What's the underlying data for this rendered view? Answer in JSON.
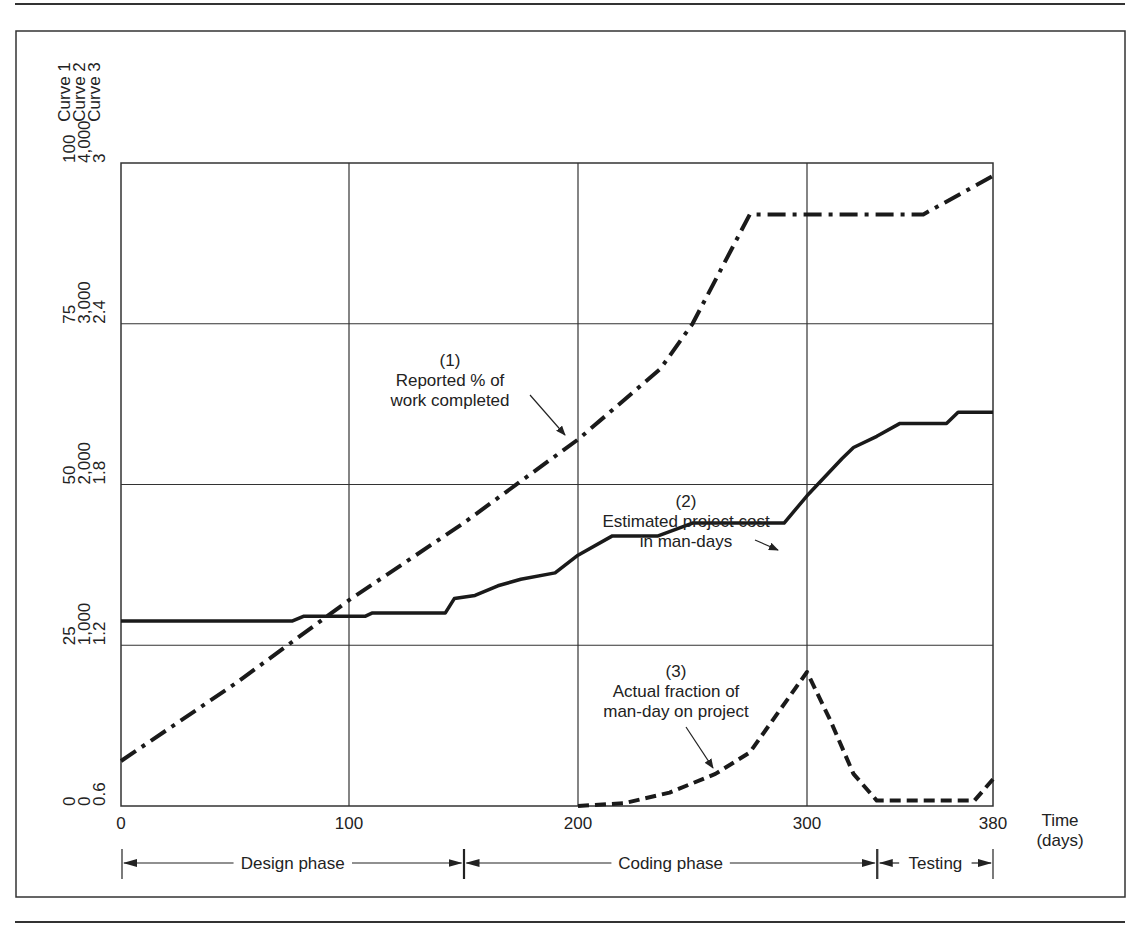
{
  "figure": {
    "y_axis_headers": [
      "Curve 1",
      "Curve 2",
      "Curve 3"
    ],
    "y_ticks": {
      "curve1": [
        "0",
        "25",
        "50",
        "75",
        "100"
      ],
      "curve2": [
        "0",
        "1,000",
        "2,000",
        "3,000",
        "4,000"
      ],
      "curve3": [
        "0.6",
        "1.2",
        "1.8",
        "2.4",
        "3"
      ]
    },
    "x_ticks": [
      "0",
      "100",
      "200",
      "300",
      "380"
    ],
    "x_label_line1": "Time",
    "x_label_line2": "(days)",
    "annotations": {
      "curve1": {
        "num": "(1)",
        "line1": "Reported % of",
        "line2": "work completed"
      },
      "curve2": {
        "num": "(2)",
        "line1": "Estimated project cost",
        "line2": "in man-days"
      },
      "curve3": {
        "num": "(3)",
        "line1": "Actual fraction of",
        "line2": "man-day on project"
      }
    },
    "phases": [
      {
        "label": "Design phase",
        "start": 0,
        "end": 150
      },
      {
        "label": "Coding phase",
        "start": 150,
        "end": 330
      },
      {
        "label": "Testing",
        "start": 330,
        "end": 380
      }
    ]
  },
  "chart_data": {
    "type": "line",
    "title": "",
    "xlabel": "Time (days)",
    "ylabel": "Curve 1 (%) / Curve 2 (man-days) / Curve 3 (fraction)",
    "xlim": [
      0,
      380
    ],
    "grid": true,
    "x_ticks": [
      0,
      100,
      200,
      300,
      380
    ],
    "y_axes": [
      {
        "name": "Curve 1",
        "range": [
          0,
          100
        ],
        "ticks": [
          0,
          25,
          50,
          75,
          100
        ]
      },
      {
        "name": "Curve 2",
        "range": [
          0,
          4000
        ],
        "ticks": [
          0,
          1000,
          2000,
          3000,
          4000
        ]
      },
      {
        "name": "Curve 3",
        "range": [
          0.6,
          3
        ],
        "ticks": [
          0.6,
          1.2,
          1.8,
          2.4,
          3
        ]
      }
    ],
    "series": [
      {
        "name": "(1) Reported % of work completed",
        "axis": "Curve 1",
        "style": "dash-dot",
        "x": [
          0,
          50,
          100,
          150,
          200,
          236,
          250,
          275,
          300,
          350,
          380
        ],
        "y": [
          7,
          19,
          32,
          44,
          57,
          68,
          75,
          92,
          92,
          92,
          98
        ]
      },
      {
        "name": "(2) Estimated project cost in man-days",
        "axis": "Curve 2",
        "style": "solid-step",
        "x": [
          0,
          75,
          80,
          107,
          110,
          142,
          146,
          155,
          165,
          175,
          190,
          200,
          215,
          235,
          250,
          290,
          300,
          315,
          320,
          330,
          340,
          360,
          365,
          380
        ],
        "y": [
          1150,
          1150,
          1180,
          1180,
          1200,
          1200,
          1290,
          1310,
          1370,
          1410,
          1450,
          1560,
          1680,
          1680,
          1760,
          1760,
          1930,
          2160,
          2230,
          2300,
          2380,
          2380,
          2450,
          2450
        ]
      },
      {
        "name": "(3) Actual fraction of man-day on project",
        "axis": "Curve 3",
        "style": "dashed",
        "x": [
          200,
          220,
          240,
          260,
          275,
          285,
          295,
          300,
          310,
          320,
          330,
          360,
          372,
          380
        ],
        "y": [
          0.6,
          0.61,
          0.65,
          0.72,
          0.8,
          0.92,
          1.04,
          1.1,
          0.92,
          0.72,
          0.62,
          0.62,
          0.62,
          0.7
        ]
      }
    ],
    "annotations": [
      "(1) Reported % of work completed",
      "(2) Estimated project cost in man-days",
      "(3) Actual fraction of man-day on project"
    ],
    "phases": [
      "Design phase (0-150)",
      "Coding phase (150-330)",
      "Testing (330-380)"
    ]
  }
}
